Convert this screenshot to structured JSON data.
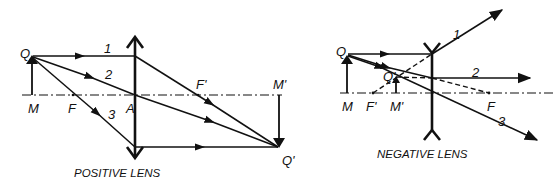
{
  "figure": {
    "positive_lens": {
      "caption": "POSITIVE LENS",
      "labels": {
        "object_top": "Q",
        "object_base": "M",
        "focal_front": "F",
        "center": "A",
        "focal_back": "F'",
        "image_base": "M'",
        "image_top": "Q'"
      },
      "ray_numbers": [
        "1",
        "2",
        "3"
      ]
    },
    "negative_lens": {
      "caption": "NEGATIVE LENS",
      "labels": {
        "object_top": "Q",
        "object_base": "M",
        "focal_front": "F'",
        "image_base": "M'",
        "image_top": "Q'",
        "focal_back": "F"
      },
      "ray_numbers": [
        "1",
        "2",
        "3"
      ]
    }
  }
}
